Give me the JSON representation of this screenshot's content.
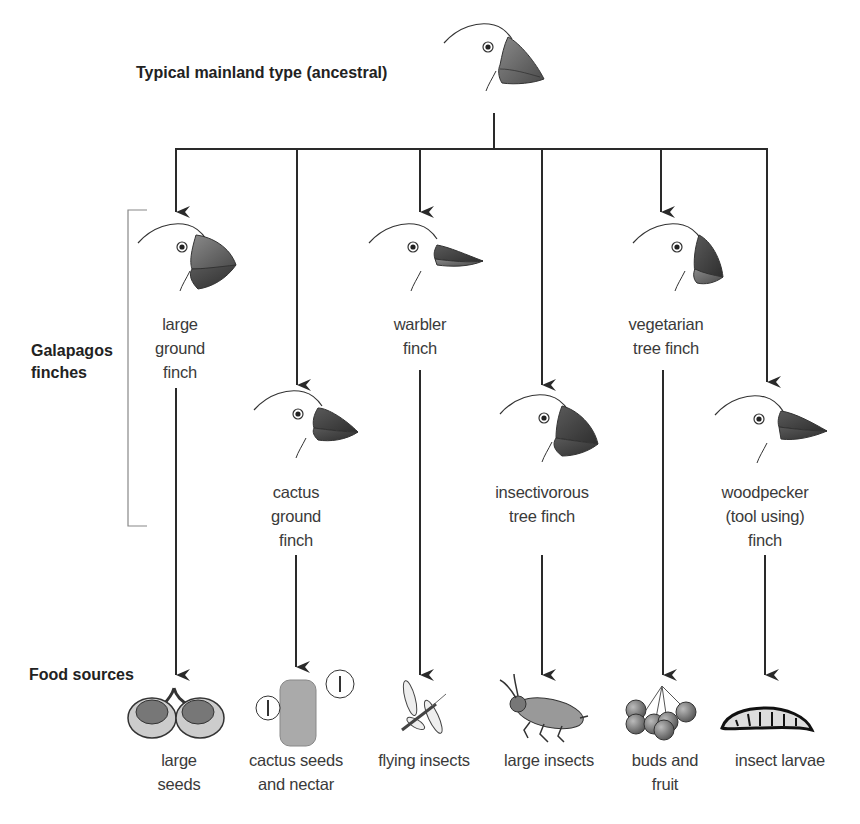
{
  "diagram": {
    "ancestor": {
      "label": "Typical mainland type (ancestral)",
      "beak": "medium-thick"
    },
    "group_label": "Galapagos\nfinches",
    "food_sources_label": "Food sources",
    "colors": {
      "line": "#2a2a2a",
      "beak": "#6a6a6a",
      "beak_dark": "#3e3e3e",
      "text": "#3a3a3a",
      "bracket": "#888888"
    },
    "finches": [
      {
        "name": "large\nground\nfinch",
        "beak": "large-crushing",
        "food": "large\nseeds",
        "food_icon": "seeds-icon"
      },
      {
        "name": "cactus\nground\nfinch",
        "beak": "long-pointed",
        "food": "cactus seeds\nand nectar",
        "food_icon": "cactus-flower-icon"
      },
      {
        "name": "warbler\nfinch",
        "beak": "thin-probing",
        "food": "flying insects",
        "food_icon": "dragonfly-icon"
      },
      {
        "name": "insectivorous\ntree finch",
        "beak": "grasping",
        "food": "large insects",
        "food_icon": "beetle-icon"
      },
      {
        "name": "vegetarian\ntree finch",
        "beak": "parrot-like",
        "food": "buds and\nfruit",
        "food_icon": "berries-icon"
      },
      {
        "name": "woodpecker\n(tool using)\nfinch",
        "beak": "chisel",
        "food": "insect larvae",
        "food_icon": "larva-icon"
      }
    ]
  }
}
